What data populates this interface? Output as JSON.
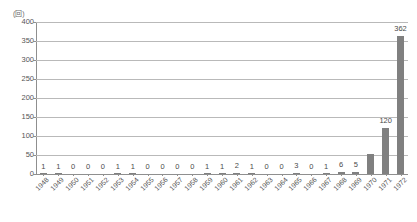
{
  "chart_data": {
    "type": "bar",
    "title": "",
    "subtitle": "",
    "xlabel": "",
    "ylabel": "(回)",
    "unit_note": "(回)",
    "ylim": [
      0,
      400
    ],
    "ytick_labels": [
      "0",
      "50",
      "100",
      "150",
      "200",
      "250",
      "300",
      "350",
      "400"
    ],
    "ytick_values": [
      0,
      50,
      100,
      150,
      200,
      250,
      300,
      350,
      400
    ],
    "grid": true,
    "legend": "none",
    "categories": [
      "1948",
      "1949",
      "1950",
      "1951",
      "1952",
      "1953",
      "1954",
      "1955",
      "1956",
      "1957",
      "1958",
      "1959",
      "1960",
      "1961",
      "1962",
      "1963",
      "1964",
      "1965",
      "1966",
      "1967",
      "1968",
      "1969",
      "1970",
      "1971",
      "1972"
    ],
    "values": [
      1,
      1,
      0,
      0,
      0,
      1,
      1,
      0,
      0,
      0,
      0,
      1,
      1,
      2,
      1,
      0,
      0,
      3,
      0,
      1,
      6,
      5,
      52,
      120,
      362
    ],
    "data_labels": [
      "1",
      "1",
      "0",
      "0",
      "0",
      "1",
      "1",
      "0",
      "0",
      "0",
      "0",
      "1",
      "1",
      "2",
      "1",
      "0",
      "0",
      "3",
      "0",
      "1",
      "6",
      "5",
      "",
      "120",
      "362"
    ],
    "bar_color": "#808080",
    "grid_color": "#b9b9b9",
    "axis_color": "#8f8f8f",
    "text_color": "#555555"
  }
}
